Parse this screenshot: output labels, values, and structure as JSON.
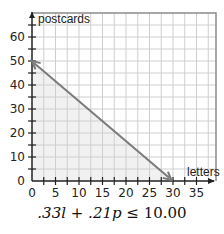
{
  "chart_data": {
    "type": "line",
    "title": "",
    "xlabel": "letters",
    "ylabel": "postcards",
    "xlim": [
      0,
      39
    ],
    "ylim": [
      0,
      70
    ],
    "x_ticks": [
      0,
      5,
      10,
      15,
      20,
      25,
      30,
      35
    ],
    "y_ticks": [
      0,
      10,
      20,
      30,
      40,
      50,
      60
    ],
    "x_minor_step": 2.5,
    "y_minor_step": 5,
    "grid": true,
    "series": [
      {
        "name": "boundary",
        "x": [
          0,
          30.3
        ],
        "y": [
          50,
          0
        ],
        "style": "double-arrow"
      }
    ],
    "shaded_region": {
      "vertices": [
        [
          0,
          0
        ],
        [
          0,
          50
        ],
        [
          30.3,
          0
        ]
      ],
      "color": "#f1f1f1"
    },
    "annotation": ".33l + .21p ≤ 10.00"
  },
  "caption": {
    "pre": ".33",
    "var1": "l",
    "mid": " + .21",
    "var2": "p",
    "post": " ≤ 10.00"
  },
  "colors": {
    "grid": "#cfcfcf",
    "axis": "#222222",
    "line": "#7a7a7a",
    "shade": "#f1f1f1",
    "border": "#8a8a8a"
  }
}
